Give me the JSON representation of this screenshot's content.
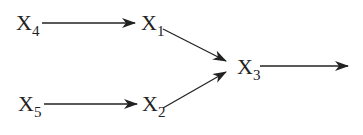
{
  "diagram": {
    "nodes": [
      {
        "id": "x4",
        "label": "X",
        "sub": "4"
      },
      {
        "id": "x1",
        "label": "X",
        "sub": "1"
      },
      {
        "id": "x5",
        "label": "X",
        "sub": "5"
      },
      {
        "id": "x2",
        "label": "X",
        "sub": "2"
      },
      {
        "id": "x3",
        "label": "X",
        "sub": "3"
      }
    ],
    "edges": [
      {
        "from": "x4",
        "to": "x1"
      },
      {
        "from": "x5",
        "to": "x2"
      },
      {
        "from": "x1",
        "to": "x3"
      },
      {
        "from": "x2",
        "to": "x3"
      },
      {
        "from": "x3",
        "to": "output"
      }
    ],
    "colors": {
      "line": "#222222",
      "background": "#ffffff"
    }
  }
}
